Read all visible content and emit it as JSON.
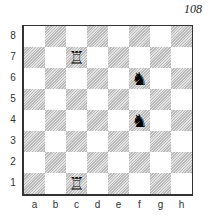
{
  "diagram_number": "108",
  "ranks": [
    "8",
    "7",
    "6",
    "5",
    "4",
    "3",
    "2",
    "1"
  ],
  "files": [
    "a",
    "b",
    "c",
    "d",
    "e",
    "f",
    "g",
    "h"
  ],
  "pieces": [
    {
      "square": "c7",
      "piece": "white-rook",
      "glyph": "♖"
    },
    {
      "square": "f6",
      "piece": "black-knight",
      "glyph": "♞"
    },
    {
      "square": "f4",
      "piece": "black-knight",
      "glyph": "♞"
    },
    {
      "square": "c1",
      "piece": "white-rook",
      "glyph": "♖"
    }
  ],
  "colors": {
    "border": "#333333",
    "light_square": "#ffffff",
    "dark_square_hatch": "#bbbbbb"
  }
}
